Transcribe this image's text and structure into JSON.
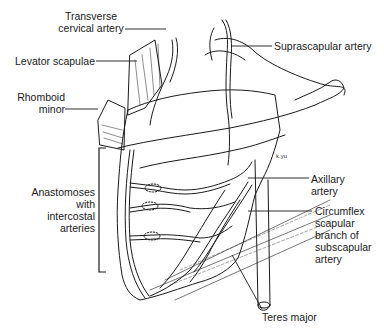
{
  "figure": {
    "type": "anatomical line drawing",
    "background_color": "#ffffff",
    "line_color": "#1a1a1a"
  },
  "labels": {
    "transverse_cervical": {
      "line1": "Transverse",
      "line2": "cervical artery"
    },
    "suprascapular": {
      "text": "Suprascapular artery"
    },
    "levator_scapulae": {
      "text": "Levator scapulae"
    },
    "rhomboid_minor": {
      "line1": "Rhomboid",
      "line2": "minor"
    },
    "anastomoses": {
      "line1": "Anastomoses",
      "line2": "with",
      "line3": "intercostal",
      "line4": "arteries"
    },
    "axillary": {
      "line1": "Axillary",
      "line2": "artery"
    },
    "circumflex": {
      "line1": "Circumflex",
      "line2": "scapular",
      "line3": "branch of",
      "line4": "subscapular",
      "line5": "artery"
    },
    "teres_major": {
      "text": "Teres major"
    },
    "signature": {
      "text": "k.yu"
    }
  }
}
